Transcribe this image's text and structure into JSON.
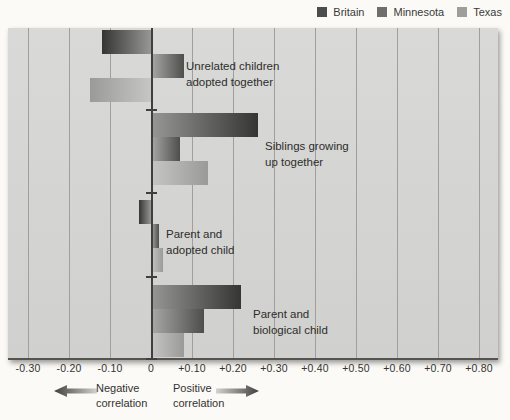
{
  "legend": {
    "items": [
      {
        "label": "Britain",
        "color": "#4c4c4a"
      },
      {
        "label": "Minnesota",
        "color": "#6e6e6c"
      },
      {
        "label": "Texas",
        "color": "#9e9e9c"
      }
    ]
  },
  "chart_data": {
    "type": "bar",
    "orientation": "horizontal",
    "xlabel": "Correlation",
    "axis": {
      "min": -0.3,
      "max": 0.8,
      "step": 0.1,
      "tick_values": [
        -0.3,
        -0.2,
        -0.1,
        0,
        0.1,
        0.2,
        0.3,
        0.4,
        0.5,
        0.6,
        0.7,
        0.8
      ],
      "tick_labels": [
        "-0.30",
        "-0.20",
        "-0.10",
        "0",
        "+0.10",
        "+0.20",
        "+0.30",
        "+0.40",
        "+0.50",
        "+0.60",
        "+0.70",
        "+0.80"
      ],
      "grid": true
    },
    "series_names": [
      "Britain",
      "Minnesota",
      "Texas"
    ],
    "series_colors": [
      {
        "name": "Britain",
        "tip": "#353534",
        "base": "#979795"
      },
      {
        "name": "Minnesota",
        "tip": "#4e4e4c",
        "base": "#a9a9a7"
      },
      {
        "name": "Texas",
        "tip": "#9a9a98",
        "base": "#c6c6c4"
      }
    ],
    "groups": [
      {
        "label": "Unrelated children adopted together",
        "label_lines": [
          "Unrelated children",
          "adopted together"
        ],
        "values": [
          -0.12,
          0.08,
          -0.15
        ]
      },
      {
        "label": "Siblings growing up together",
        "label_lines": [
          "Siblings growing",
          "up together"
        ],
        "values": [
          0.26,
          0.07,
          0.14
        ]
      },
      {
        "label": "Parent and adopted child",
        "label_lines": [
          "Parent and",
          "adopted child"
        ],
        "values": [
          -0.03,
          0.02,
          0.03
        ]
      },
      {
        "label": "Parent and biological child",
        "label_lines": [
          "Parent and",
          "biological child"
        ],
        "values": [
          0.22,
          0.13,
          0.08
        ]
      }
    ],
    "legend_position": "top-right"
  },
  "annotations": {
    "negative": {
      "line1": "Negative",
      "line2": "correlation"
    },
    "positive": {
      "line1": "Positive",
      "line2": "correlation"
    }
  },
  "colors": {
    "plot_background": "#d5d5d3",
    "gridline": "#a09f9d",
    "zero_axis": "#403f3d",
    "arrow_dark": "#3f3f3d",
    "arrow_light": "#d2d2d0"
  }
}
